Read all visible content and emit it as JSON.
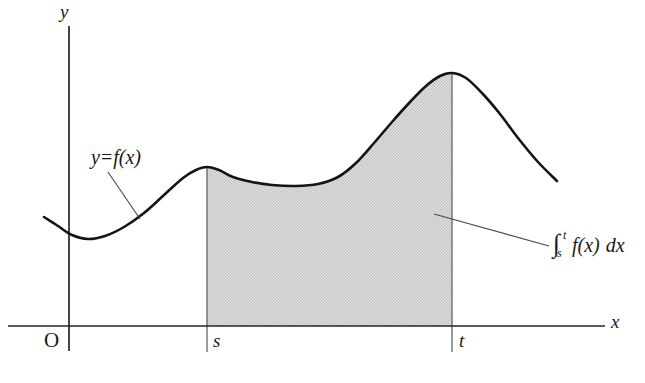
{
  "figure": {
    "background_color": "#ffffff",
    "ink_color": "#1a1a1a",
    "shade_color": "#d2d2d2"
  },
  "axes": {
    "y_axis_label": "y",
    "x_axis_label": "x",
    "origin_label": "O"
  },
  "ticks": {
    "lower_limit_label": "s",
    "upper_limit_label": "t"
  },
  "curve_annotation": {
    "lhs": "y",
    "equals": "=",
    "rhs": "f(x)"
  },
  "integral_annotation": {
    "symbol": "∫",
    "lower_limit": "s",
    "upper_limit": "t",
    "integrand": "f(x)",
    "differential": "dx"
  },
  "chart_data": {
    "type": "line",
    "title": "",
    "xlabel": "x",
    "ylabel": "y",
    "grid": false,
    "legend": false,
    "axis_pixel_geometry": {
      "x_axis_y": 326,
      "y_axis_x": 69,
      "x_axis_start": 8,
      "x_axis_end": 605,
      "y_axis_top": 26,
      "y_axis_bottom": 351
    },
    "shaded_region": {
      "label": "area under f between s and t",
      "x_from": 207,
      "x_to": 452,
      "fill": "#d2d2d2"
    },
    "limits": {
      "s_x": 207,
      "t_x": 452
    },
    "series": [
      {
        "name": "f(x)",
        "points": [
          [
            44,
            217
          ],
          [
            58,
            226
          ],
          [
            72,
            235
          ],
          [
            88,
            239
          ],
          [
            105,
            236
          ],
          [
            124,
            227
          ],
          [
            144,
            213
          ],
          [
            164,
            195
          ],
          [
            183,
            178
          ],
          [
            196,
            170
          ],
          [
            207,
            167
          ],
          [
            219,
            170
          ],
          [
            233,
            177
          ],
          [
            252,
            182
          ],
          [
            272,
            185
          ],
          [
            296,
            186
          ],
          [
            318,
            184
          ],
          [
            338,
            177
          ],
          [
            356,
            163
          ],
          [
            374,
            143
          ],
          [
            392,
            122
          ],
          [
            410,
            102
          ],
          [
            426,
            86
          ],
          [
            440,
            76
          ],
          [
            452,
            73
          ],
          [
            466,
            78
          ],
          [
            482,
            93
          ],
          [
            500,
            114
          ],
          [
            518,
            138
          ],
          [
            538,
            162
          ],
          [
            557,
            181
          ]
        ]
      }
    ]
  },
  "leaders": {
    "curve_leader": {
      "from_x": 108,
      "from_y": 172,
      "to_x": 140,
      "to_y": 219
    },
    "integral_leader": {
      "from_x": 434,
      "from_y": 214,
      "to_x": 549,
      "to_y": 246
    }
  }
}
